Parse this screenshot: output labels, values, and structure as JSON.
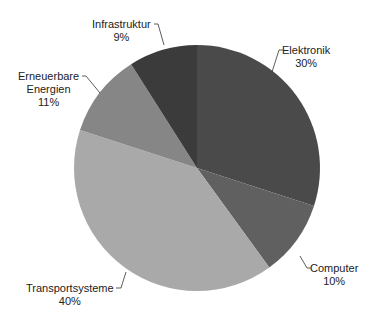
{
  "chart_data": {
    "type": "pie",
    "title": "",
    "start_angle_deg": 0,
    "direction": "clockwise",
    "slices": [
      {
        "label": "Elektronik",
        "value": 30,
        "display": "30%",
        "color": "#4a4a4a"
      },
      {
        "label": "Computer",
        "value": 10,
        "display": "10%",
        "color": "#606060"
      },
      {
        "label": "Transportsysteme",
        "value": 40,
        "display": "40%",
        "color": "#a9a9a9"
      },
      {
        "label": "Erneuerbare Energien",
        "value": 11,
        "display": "11%",
        "color": "#868686"
      },
      {
        "label": "Infrastruktur",
        "value": 9,
        "display": "9%",
        "color": "#3b3b3b"
      }
    ],
    "legend": "none",
    "labels_outside_with_leader_lines": true
  },
  "labels": {
    "elektronik": {
      "name": "Elektronik",
      "pct": "30%"
    },
    "computer": {
      "name": "Computer",
      "pct": "10%"
    },
    "transport": {
      "name": "Transportsysteme",
      "pct": "40%"
    },
    "erneuerbare_1": "Erneuerbare",
    "erneuerbare_2": "Energien",
    "erneuerbare_pct": "11%",
    "infrastruktur": {
      "name": "Infrastruktur",
      "pct": "9%"
    }
  }
}
